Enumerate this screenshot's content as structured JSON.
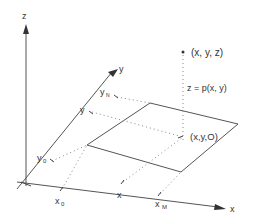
{
  "diagram": {
    "axes": {
      "z_label": "z",
      "y_label": "y",
      "x_label": "x"
    },
    "y_ticks": {
      "y_N": "y",
      "y_N_sub": "N",
      "y": "y",
      "y_0": "y",
      "y_0_sub": "0"
    },
    "x_ticks": {
      "x_0": "x",
      "x_0_sub": "0",
      "x": "x",
      "x_M": "x",
      "x_M_sub": "M"
    },
    "point_labels": {
      "surface_point": "(x, y, z)",
      "function": "z = p(x, y)",
      "base_point": "(x,y,O)"
    },
    "colors": {
      "line": "#555555",
      "dots": "#888888",
      "text": "#333333"
    }
  }
}
